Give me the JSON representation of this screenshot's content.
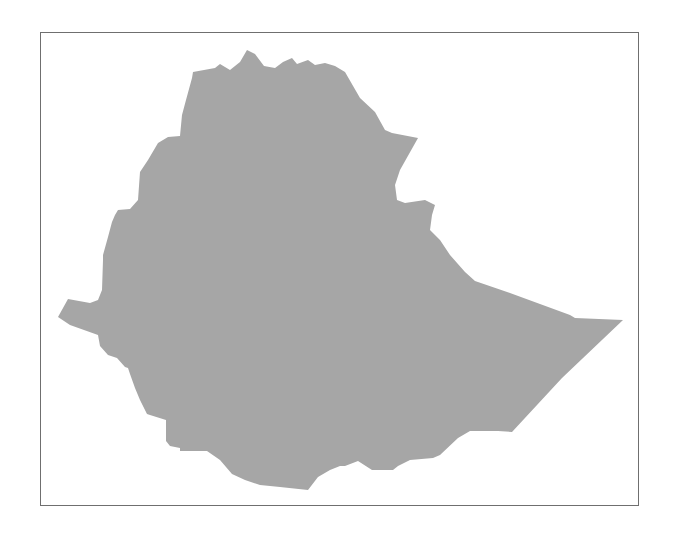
{
  "map": {
    "country": "Ethiopia",
    "fill_color": "#a6a6a6",
    "frame_color": "#6f6f6f",
    "background_color": "#ffffff",
    "outline_points": "193,72 215,68 220,64 230,70 240,62 247,50 255,54 264,66 275,68 283,62 292,58 297,64 308,60 315,65 325,63 335,66 345,72 360,98 375,112 385,130 392,133 418,138 400,170 395,185 397,200 405,203 425,200 435,205 432,215 430,230 440,240 450,255 465,272 475,281 510,293 570,315 575,318 623,320 562,378 512,432 498,431 470,431 458,438 440,455 433,458 410,460 398,466 393,470 372,470 358,461 345,466 340,466 330,470 318,477 308,490 280,487 260,485 245,480 232,474 220,460 207,451 180,451 180,448 170,446 166,441 166,420 150,415 147,414 140,400 135,388 130,374 128,368 125,367 117,358 108,355 100,346 98,335 70,325 58,317 68,299 90,303 98,300 102,290 103,260 103,255 108,237 112,222 115,215 118,210 130,209 138,200 140,172 148,160 158,143 168,137 180,136 182,115 186,100 192,78"
  }
}
